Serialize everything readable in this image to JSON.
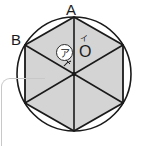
{
  "figure": {
    "labels": {
      "vertex_top": "A",
      "vertex_upper_left": "B",
      "center": "O",
      "center_mark": "イ",
      "angle_label": "ア"
    },
    "colors": {
      "stroke": "#1a1a1a",
      "hexagon_fill": "#d4d4d4",
      "background": "#ffffff",
      "panel_border": "#c8c8c8"
    },
    "geometry": {
      "circle_center_x": 74,
      "circle_center_y": 74,
      "circle_radius": 57,
      "hexagon_vertices": [
        [
          74,
          17
        ],
        [
          123,
          45
        ],
        [
          123,
          103
        ],
        [
          74,
          131
        ],
        [
          25,
          103
        ],
        [
          25,
          45
        ]
      ],
      "triangle_count": 6
    }
  },
  "panel": {
    "name": "rounded-panel-corner"
  }
}
